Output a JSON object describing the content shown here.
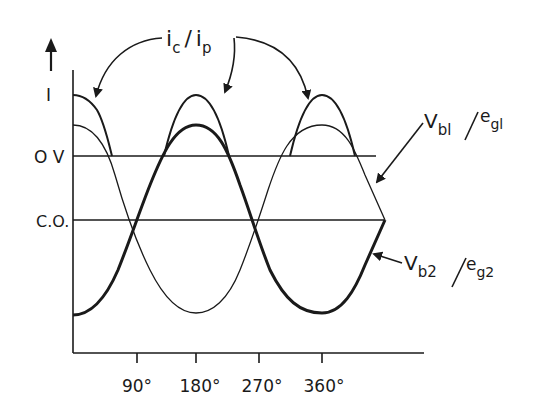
{
  "diagram": {
    "axis": {
      "y_label": "I",
      "y_levels": [
        {
          "label": "I",
          "y": 95
        },
        {
          "label": "O V",
          "y": 156
        },
        {
          "label": "C.O.",
          "y": 220
        }
      ],
      "x_ticks": [
        "90°",
        "180°",
        "270°",
        "360°"
      ]
    },
    "labels": {
      "current": {
        "main": "i",
        "sub": "c",
        "sep": "/",
        "main2": "i",
        "sub2": "p"
      },
      "vb1": {
        "main": "V",
        "sub": "bl",
        "sep": "/",
        "main2": "e",
        "sub2": "gl"
      },
      "vb2": {
        "main": "V",
        "sub": "b2",
        "sep": "/",
        "main2": "e",
        "sub2": "g2"
      }
    },
    "colors": {
      "ink": "#1a1a1a",
      "background": "#ffffff"
    }
  }
}
